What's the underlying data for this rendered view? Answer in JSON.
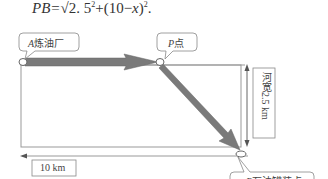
{
  "formula": {
    "lhs": "PB=",
    "rhs": "√2. 5² + (10 − x)².",
    "full": "PB=√(2.5²+(10−x)²)."
  },
  "callouts": {
    "A": {
      "letter": "A",
      "text": "炼油厂"
    },
    "P": {
      "letter": "P",
      "text": "点"
    },
    "B": {
      "letter": "B",
      "text": "石油罐装点"
    }
  },
  "dimensions": {
    "width_label": "河宽2.5 km",
    "length_label": "10 km"
  },
  "colors": {
    "arrow_fill": "#7a7a7a",
    "line": "#888888",
    "text": "#444444"
  }
}
